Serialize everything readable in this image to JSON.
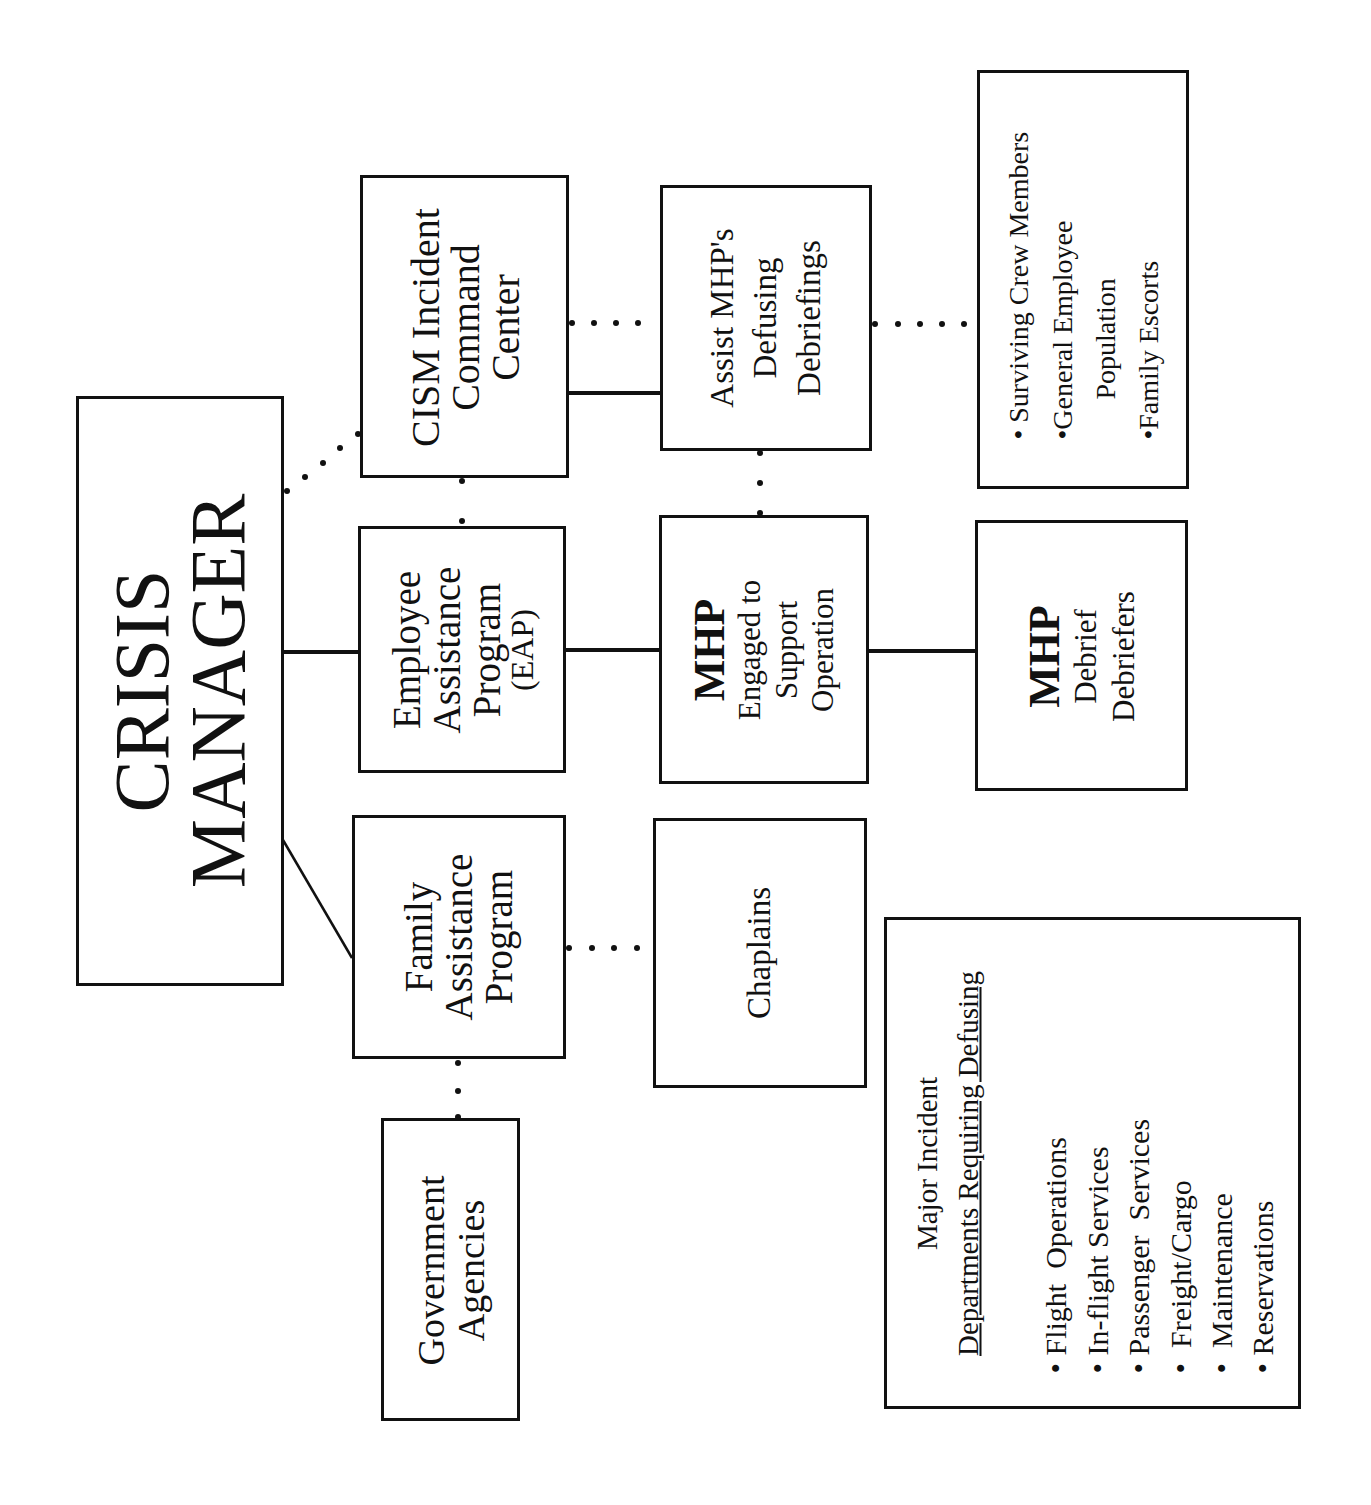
{
  "diagram": {
    "root": {
      "lines": [
        "CRISIS",
        "MANAGER"
      ]
    },
    "cism": {
      "lines": [
        "CISM Incident",
        "Command",
        "Center"
      ]
    },
    "eap": {
      "lines": [
        "Employee",
        "Assistance",
        "Program",
        "(EAP)"
      ]
    },
    "fap": {
      "lines": [
        "Family",
        "Assistance",
        "Program"
      ]
    },
    "gov": {
      "lines": [
        "Government",
        "Agencies"
      ]
    },
    "assist": {
      "lines": [
        "Assist MHP's",
        "Defusing",
        "Debriefings"
      ]
    },
    "mhp_engaged": {
      "title": "MHP",
      "lines": [
        "Engaged to",
        "Support",
        "Operation"
      ]
    },
    "chaplains": {
      "label": "Chaplains"
    },
    "mhp_debrief": {
      "title": "MHP",
      "lines": [
        "Debrief",
        "Debriefers"
      ]
    },
    "targets": {
      "items": [
        "• Surviving Crew Members",
        "•General Employee",
        "Population",
        "•Family Escorts"
      ]
    },
    "departments": {
      "heading": "Major Incident",
      "subheading": "Departments Requiring Defusing",
      "items": [
        "• Flight  Operations",
        "• In-flight Services",
        "• Passenger  Services",
        "•  Freight/Cargo",
        "•  Maintenance",
        "• Reservations"
      ]
    }
  }
}
